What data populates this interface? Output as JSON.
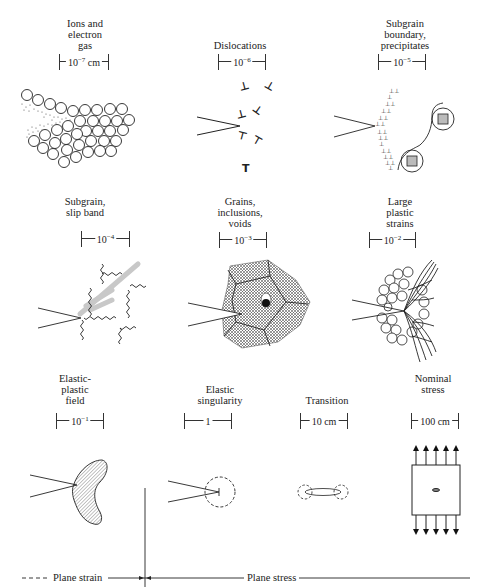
{
  "figure": {
    "rows": [
      {
        "panels": [
          {
            "id": "ions",
            "label_lines": [
              "Ions and",
              "electron",
              "gas"
            ],
            "scale_base": "10",
            "scale_exp": "−7",
            "scale_unit": " cm"
          },
          {
            "id": "dislocations",
            "label_lines": [
              "Dislocations"
            ],
            "scale_base": "10",
            "scale_exp": "−6",
            "scale_unit": ""
          },
          {
            "id": "subgrain-boundary",
            "label_lines": [
              "Subgrain",
              "boundary,",
              "precipitates"
            ],
            "scale_base": "10",
            "scale_exp": "−5",
            "scale_unit": ""
          }
        ]
      },
      {
        "panels": [
          {
            "id": "subgrain-slip",
            "label_lines": [
              "Subgrain,",
              "slip band"
            ],
            "scale_base": "10",
            "scale_exp": "−4",
            "scale_unit": ""
          },
          {
            "id": "grains",
            "label_lines": [
              "Grains,",
              "inclusions,",
              "voids"
            ],
            "scale_base": "10",
            "scale_exp": "−3",
            "scale_unit": ""
          },
          {
            "id": "large-plastic",
            "label_lines": [
              "Large",
              "plastic",
              "strains"
            ],
            "scale_base": "10",
            "scale_exp": "−2",
            "scale_unit": ""
          }
        ]
      },
      {
        "panels": [
          {
            "id": "elastic-plastic",
            "label_lines": [
              "Elastic-",
              "plastic",
              "field"
            ],
            "scale_base": "10",
            "scale_exp": "−1",
            "scale_unit": ""
          },
          {
            "id": "elastic-singularity",
            "label_lines": [
              "Elastic",
              "singularity"
            ],
            "scale_base": "1",
            "scale_exp": "",
            "scale_unit": ""
          },
          {
            "id": "transition",
            "label_lines": [
              "Transition"
            ],
            "scale_base": "10",
            "scale_exp": "",
            "scale_unit": " cm"
          },
          {
            "id": "nominal-stress",
            "label_lines": [
              "Nominal",
              "stress"
            ],
            "scale_base": "100",
            "scale_exp": "",
            "scale_unit": " cm"
          }
        ]
      }
    ],
    "regimes": {
      "plane_strain": "Plane strain",
      "plane_stress": "Plane stress"
    },
    "colors": {
      "ink": "#222222",
      "hatch": "#555555",
      "gray_band": "#c8c8c8",
      "precipitate_fill": "#bbbbbb"
    }
  }
}
